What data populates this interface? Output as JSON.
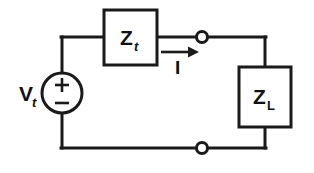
{
  "figure": {
    "type": "circuit-diagram",
    "width": 314,
    "height": 173,
    "background_color": "#ffffff",
    "line_color": "#1a1a1a",
    "text_color": "#111111"
  },
  "source": {
    "name": "voltage-source",
    "label_main": "V",
    "label_subscript": "t",
    "polarity_top": "+",
    "polarity_bottom": "−",
    "shape": "circle"
  },
  "components": [
    {
      "name": "thevenin-impedance",
      "label_main": "Z",
      "label_subscript": "t",
      "subscript_style": "italic",
      "shape": "rectangle"
    },
    {
      "name": "load-impedance",
      "label_main": "Z",
      "label_subscript": "L",
      "subscript_style": "roman",
      "shape": "rectangle"
    }
  ],
  "current": {
    "name": "branch-current",
    "label": "I",
    "direction": "right"
  },
  "terminals": [
    {
      "name": "terminal-top",
      "type": "open-node"
    },
    {
      "name": "terminal-bottom",
      "type": "open-node"
    }
  ]
}
